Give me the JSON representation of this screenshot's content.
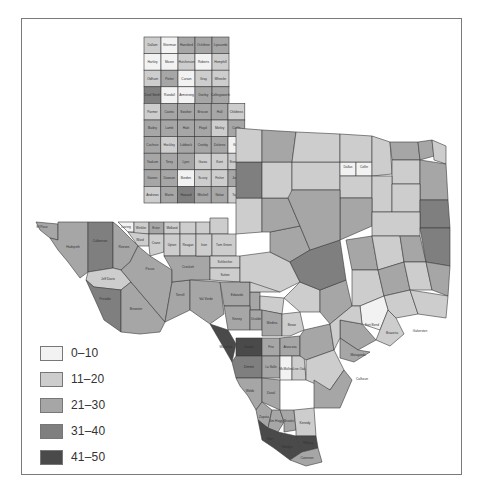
{
  "map": {
    "region": "Texas counties",
    "legend": {
      "items": [
        {
          "label": "0–10",
          "color": "#f2f2f2"
        },
        {
          "label": "11–20",
          "color": "#cdcdcd"
        },
        {
          "label": "21–30",
          "color": "#a6a6a6"
        },
        {
          "label": "31–40",
          "color": "#7f7f7f"
        },
        {
          "label": "41–50",
          "color": "#4a4a4a"
        }
      ]
    },
    "panhandle_grid": [
      [
        "Dallam",
        "Sherman",
        "Hansford",
        "Ochiltree",
        "Lipscomb"
      ],
      [
        "Hartley",
        "Moore",
        "Hutchinson",
        "Roberts",
        "Hemphill"
      ],
      [
        "Oldham",
        "Potter",
        "Carson",
        "Gray",
        "Wheeler"
      ],
      [
        "Deaf Smith",
        "Randall",
        "Armstrong",
        "Donley",
        "Collingsworth"
      ],
      [
        "Parmer",
        "Castro",
        "Swisher",
        "Briscoe",
        "Hall",
        "Childress"
      ],
      [
        "Bailey",
        "Lamb",
        "Hale",
        "Floyd",
        "Motley",
        "Cottle"
      ],
      [
        "Cochran",
        "Hockley",
        "Lubbock",
        "Crosby",
        "Dickens",
        "King"
      ],
      [
        "Yoakum",
        "Terry",
        "Lynn",
        "Garza",
        "Kent",
        "Stonewall"
      ],
      [
        "Gaines",
        "Dawson",
        "Borden",
        "Scurry",
        "Fisher",
        "Jones"
      ],
      [
        "Andrews",
        "Martin",
        "Howard",
        "Mitchell",
        "Nolan",
        "Taylor"
      ]
    ],
    "panhandle_categories": [
      [
        2,
        1,
        3,
        3,
        3
      ],
      [
        1,
        1,
        2,
        1,
        2
      ],
      [
        2,
        3,
        1,
        2,
        2
      ],
      [
        4,
        1,
        1,
        3,
        3
      ],
      [
        2,
        3,
        3,
        3,
        3,
        2
      ],
      [
        3,
        3,
        3,
        3,
        2,
        3
      ],
      [
        3,
        2,
        3,
        3,
        3,
        1
      ],
      [
        3,
        3,
        3,
        2,
        2,
        2
      ],
      [
        3,
        3,
        1,
        2,
        2,
        3
      ],
      [
        2,
        3,
        4,
        3,
        3,
        2
      ]
    ],
    "west_counties": [
      {
        "name": "El Paso",
        "cat": 3
      },
      {
        "name": "Hudspeth",
        "cat": 3
      },
      {
        "name": "Culberson",
        "cat": 4
      },
      {
        "name": "Jeff Davis",
        "cat": 2
      },
      {
        "name": "Reeves",
        "cat": 3
      },
      {
        "name": "Presidio",
        "cat": 4
      },
      {
        "name": "Brewster",
        "cat": 3
      },
      {
        "name": "Pecos",
        "cat": 3
      },
      {
        "name": "Terrell",
        "cat": 3
      },
      {
        "name": "Loving",
        "cat": 1
      },
      {
        "name": "Winkler",
        "cat": 2
      },
      {
        "name": "Ector",
        "cat": 3
      },
      {
        "name": "Midland",
        "cat": 2
      },
      {
        "name": "Glasscock",
        "cat": 2
      },
      {
        "name": "Ward",
        "cat": 2
      },
      {
        "name": "Crane",
        "cat": 2
      },
      {
        "name": "Upton",
        "cat": 2
      },
      {
        "name": "Reagan",
        "cat": 2
      },
      {
        "name": "Irion",
        "cat": 2
      },
      {
        "name": "Crockett",
        "cat": 3
      },
      {
        "name": "Sutton",
        "cat": 2
      },
      {
        "name": "Schleicher",
        "cat": 2
      },
      {
        "name": "Tom Green",
        "cat": 2
      },
      {
        "name": "Coke",
        "cat": 2
      },
      {
        "name": "Sterling",
        "cat": 2
      },
      {
        "name": "Val Verde",
        "cat": 3
      }
    ],
    "south_counties": [
      {
        "name": "Kinney",
        "cat": 3
      },
      {
        "name": "Uvalde",
        "cat": 3
      },
      {
        "name": "Medina",
        "cat": 3
      },
      {
        "name": "Maverick",
        "cat": 5
      },
      {
        "name": "Zavala",
        "cat": 5
      },
      {
        "name": "Frio",
        "cat": 3
      },
      {
        "name": "Dimmit",
        "cat": 4
      },
      {
        "name": "La Salle",
        "cat": 3
      },
      {
        "name": "McMullen",
        "cat": 1
      },
      {
        "name": "Live Oak",
        "cat": 2
      },
      {
        "name": "Webb",
        "cat": 3
      },
      {
        "name": "Duval",
        "cat": 3
      },
      {
        "name": "Zapata",
        "cat": 3
      },
      {
        "name": "Jim Hogg",
        "cat": 3
      },
      {
        "name": "Brooks",
        "cat": 3
      },
      {
        "name": "Kenedy",
        "cat": 2
      },
      {
        "name": "Starr",
        "cat": 5
      },
      {
        "name": "Hidalgo",
        "cat": 5
      },
      {
        "name": "Willacy",
        "cat": 5
      },
      {
        "name": "Cameron",
        "cat": 3
      },
      {
        "name": "Atascosa",
        "cat": 3
      },
      {
        "name": "Bexar",
        "cat": 2
      },
      {
        "name": "Edwards",
        "cat": 3
      },
      {
        "name": "Real",
        "cat": 3
      },
      {
        "name": "Bandera",
        "cat": 2
      },
      {
        "name": "Kerr",
        "cat": 2
      }
    ],
    "coast_labels": [
      "Galveston",
      "Calhoun",
      "Fort Bend",
      "Brazoria",
      "Matagorda",
      "Wharton",
      "Harris",
      "Chambers",
      "Jefferson",
      "Orange"
    ],
    "north_east_labels": [
      "Dallas",
      "Collin",
      "Denton",
      "Tarrant",
      "Wise",
      "Parker",
      "Palo Pinto",
      "Jack",
      "Young",
      "Clay",
      "Montague",
      "Cooke",
      "Grayson",
      "Fannin",
      "Lamar",
      "Red River",
      "Bowie",
      "Hunt",
      "Hopkins",
      "Titus",
      "Cass",
      "Marion",
      "Harrison",
      "Smith",
      "Rusk",
      "Panola",
      "Kaufman",
      "Van Zandt",
      "Wood",
      "Ellis",
      "Navarro",
      "Johnson",
      "Hill",
      "Erath",
      "Hood",
      "Somervell",
      "Bosque",
      "McLennan",
      "Limestone",
      "Freestone",
      "Anderson",
      "Cherokee",
      "Henderson"
    ]
  },
  "caption": {
    "text": ""
  }
}
